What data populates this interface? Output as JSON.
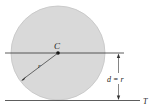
{
  "diagram": {
    "type": "geometry",
    "labels": {
      "center": "C",
      "radius": "r",
      "distance": "d = r",
      "tangent_line": "T"
    },
    "colors": {
      "circle_fill": "#d9d9d9",
      "circle_stroke": "#bdbdbd",
      "line": "#333333"
    }
  }
}
